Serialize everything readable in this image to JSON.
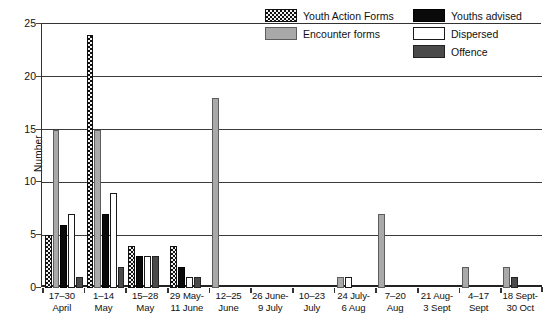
{
  "chart_data": {
    "type": "bar",
    "title": "",
    "xlabel": "",
    "ylabel": "Number",
    "ylim": [
      0,
      25
    ],
    "yticks": [
      0,
      5,
      10,
      15,
      20,
      25
    ],
    "grid": true,
    "legend_position": "top-right",
    "categories": [
      "17–30 April",
      "1–14 May",
      "15–28 May",
      "29 May–11 June",
      "12–25 June",
      "26 June–9 July",
      "10–23 July",
      "24 July–6 Aug",
      "7–20 Aug",
      "21 Aug–3 Sept",
      "4–17 Sept",
      "18 Sept–30 Oct"
    ],
    "series": [
      {
        "name": "Youth Action Forms",
        "color": "#111111",
        "pattern": "checkered",
        "values": [
          5,
          24,
          4,
          4,
          0,
          0,
          0,
          0,
          0,
          0,
          0,
          0
        ]
      },
      {
        "name": "Encounter forms",
        "color": "#a9a9a9",
        "pattern": "solid-light-gray",
        "values": [
          15,
          15,
          0,
          0,
          18,
          0,
          0,
          1,
          7,
          0,
          2,
          2
        ]
      },
      {
        "name": "Youths advised",
        "color": "#0a0a0a",
        "pattern": "solid-black",
        "values": [
          6,
          7,
          3,
          2,
          0,
          0,
          0,
          0,
          0,
          0,
          0,
          0
        ]
      },
      {
        "name": "Dispersed",
        "color": "#ffffff",
        "pattern": "solid-white",
        "values": [
          7,
          9,
          3,
          1,
          0,
          0,
          0,
          1,
          0,
          0,
          0,
          0
        ]
      },
      {
        "name": "Offence",
        "color": "#4a4a4a",
        "pattern": "solid-dark-gray",
        "values": [
          1,
          2,
          3,
          1,
          0,
          0,
          0,
          0,
          0,
          0,
          0,
          1
        ]
      }
    ]
  },
  "axis": {
    "y_title": "Number",
    "y_tick_labels": [
      "25",
      "20",
      "15",
      "10",
      "5",
      "0"
    ],
    "x_tick_labels_line1": [
      "17–30",
      "1–14",
      "15–28",
      "29 May-",
      "12–25",
      "26 June-",
      "10–23",
      "24 July-",
      "7–20",
      "21 Aug-",
      "4–17",
      "18 Sept-"
    ],
    "x_tick_labels_line2": [
      "April",
      "May",
      "May",
      "11 June",
      "June",
      "9 July",
      "July",
      "6 Aug",
      "Aug",
      "3 Sept",
      "Sept",
      "30 Oct"
    ]
  },
  "legend": {
    "column1": [
      {
        "label": "Youth Action Forms",
        "swatch": "checkered"
      },
      {
        "label": "Encounter forms",
        "swatch": "light-gray"
      }
    ],
    "column2": [
      {
        "label": "Youths advised",
        "swatch": "black"
      },
      {
        "label": "Dispersed",
        "swatch": "white"
      },
      {
        "label": "Offence",
        "swatch": "dark-gray"
      }
    ]
  }
}
